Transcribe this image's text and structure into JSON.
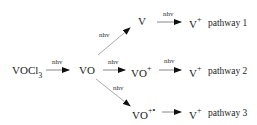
{
  "diagram": {
    "nodes": {
      "start": {
        "main": "VOCl",
        "sub": "3"
      },
      "vo": {
        "main": "VO"
      },
      "v": {
        "main": "V"
      },
      "vo_plus": {
        "main": "VO",
        "sup": "+"
      },
      "vo_plus_radical": {
        "main": "VO",
        "sup": "+•"
      },
      "v_plus_1": {
        "main": "V",
        "sup": "+"
      },
      "v_plus_2": {
        "main": "V",
        "sup": "+"
      },
      "v_plus_3": {
        "main": "V",
        "sup": "+"
      }
    },
    "arrow_labels": {
      "a1": "nhv",
      "a2": "nhv",
      "a3": "nhv",
      "a4": "nhv",
      "a5": "nhv",
      "a6": "nhv"
    },
    "pathways": [
      "pathway 1",
      "pathway 2",
      "pathway 3"
    ],
    "colors": {
      "text": "#222222",
      "arrow_shaft": "#999999",
      "arrow_head": "#111111"
    }
  }
}
